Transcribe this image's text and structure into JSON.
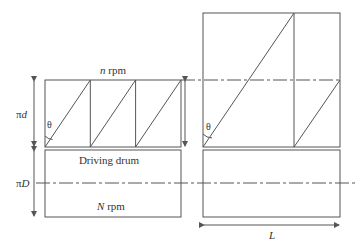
{
  "diagram": {
    "type": "belt-drum winding geometry",
    "labels": {
      "top_speed_var": "n",
      "top_speed_unit": " rpm",
      "pi_d_pi": "π",
      "pi_d_var": "d",
      "theta_left": "θ",
      "theta_right": "θ",
      "drum_name": "Driving drum",
      "pi_D_pi": "π",
      "pi_D_var": "D",
      "bottom_speed_var": "N",
      "bottom_speed_unit": " rpm",
      "length_label": "L"
    },
    "colors": {
      "line": "#555555",
      "text": "#333333",
      "background": "#ffffff"
    }
  }
}
